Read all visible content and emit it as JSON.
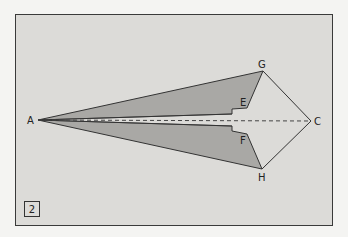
{
  "figure": {
    "step_number": "2",
    "points": {
      "A": {
        "label": "A",
        "x": 38,
        "y": 120
      },
      "G": {
        "label": "G",
        "x": 263,
        "y": 71
      },
      "C": {
        "label": "C",
        "x": 311,
        "y": 121
      },
      "H": {
        "label": "H",
        "x": 262,
        "y": 169
      },
      "E": {
        "label": "E",
        "x": 247,
        "y": 108
      },
      "F": {
        "label": "F",
        "x": 247,
        "y": 134
      }
    },
    "colors": {
      "background": "#dcdbd8",
      "fill": "#a9a8a5",
      "stroke": "#333333"
    }
  }
}
